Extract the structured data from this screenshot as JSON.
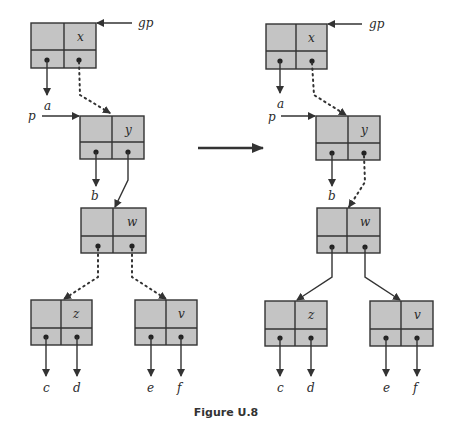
{
  "caption": "Figure U.8",
  "colors": {
    "node_fill": "#c4c4c4",
    "stroke": "#333333"
  },
  "before": {
    "nodes": {
      "x": {
        "label": "x"
      },
      "y": {
        "label": "y"
      },
      "w": {
        "label": "w"
      },
      "z": {
        "label": "z"
      },
      "v": {
        "label": "v"
      }
    },
    "pointers": {
      "gp": "gp",
      "p": "p"
    },
    "leaves": {
      "a": "a",
      "b": "b",
      "c": "c",
      "d": "d",
      "e": "e",
      "f": "f"
    }
  },
  "after": {
    "nodes": {
      "x": {
        "label": "x"
      },
      "y": {
        "label": "y"
      },
      "w": {
        "label": "w"
      },
      "z": {
        "label": "z"
      },
      "v": {
        "label": "v"
      }
    },
    "pointers": {
      "gp": "gp",
      "p": "p"
    },
    "leaves": {
      "a": "a",
      "b": "b",
      "c": "c",
      "d": "d",
      "e": "e",
      "f": "f"
    }
  },
  "transition_arrow": "right-arrow"
}
